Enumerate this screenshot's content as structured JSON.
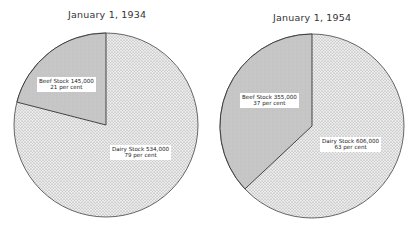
{
  "chart_data": [
    {
      "type": "pie",
      "title": "January 1, 1934",
      "categories": [
        "Beef Stock",
        "Dairy Stock"
      ],
      "values": [
        145000,
        534000
      ],
      "percentages": [
        21,
        79
      ],
      "labels": [
        {
          "line1": "Beef Stock  145,000",
          "line2": "21 per cent"
        },
        {
          "line1": "Dairy Stock  534,000",
          "line2": "79 per cent"
        }
      ],
      "fills": {
        "beef": "#c4c4c4",
        "dairy": "#e9e9e9"
      }
    },
    {
      "type": "pie",
      "title": "January 1, 1954",
      "categories": [
        "Beef Stock",
        "Dairy Stock"
      ],
      "values": [
        355000,
        606000
      ],
      "percentages": [
        37,
        63
      ],
      "labels": [
        {
          "line1": "Beef Stock  355,000",
          "line2": "37 per cent"
        },
        {
          "line1": "Dairy Stock 606,000",
          "line2": "63 per cent"
        }
      ],
      "fills": {
        "beef": "#c4c4c4",
        "dairy": "#e9e9e9"
      }
    }
  ]
}
